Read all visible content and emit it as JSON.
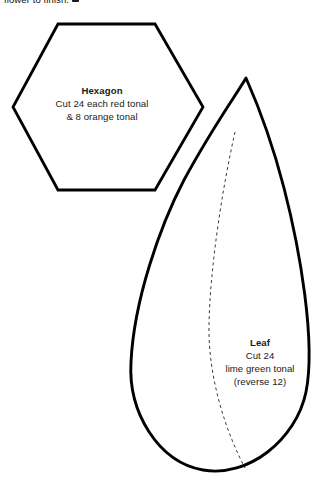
{
  "page": {
    "background_color": "#ffffff",
    "ink_color": "#000000",
    "width": 324,
    "height": 489
  },
  "header": {
    "truncated_text": "flower to finish.",
    "icon": "small-square-icon"
  },
  "templates": [
    {
      "id": "hexagon",
      "shape": "hexagon",
      "title": "Hexagon",
      "lines": [
        "Cut 24 each red tonal",
        "& 8 orange tonal"
      ]
    },
    {
      "id": "leaf",
      "shape": "leaf",
      "title": "Leaf",
      "lines": [
        "Cut 24",
        "lime green tonal",
        "(reverse 12)"
      ],
      "has_dashed_vein": true
    }
  ],
  "labels": {
    "hexagon": {
      "title": "Hexagon",
      "line1": "Cut 24 each red tonal",
      "line2": "& 8 orange tonal"
    },
    "leaf": {
      "title": "Leaf",
      "line1": "Cut 24",
      "line2": "lime green tonal",
      "line3": "(reverse 12)"
    }
  }
}
